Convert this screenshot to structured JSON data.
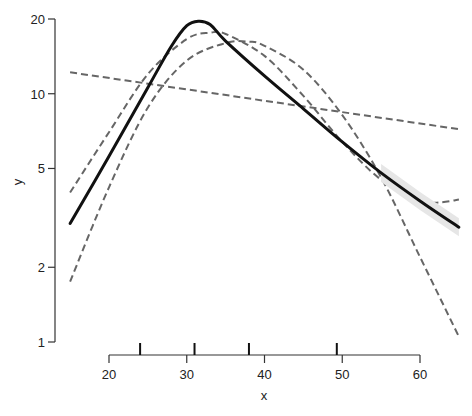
{
  "chart_data": {
    "type": "line",
    "title": "",
    "xlabel": "x",
    "ylabel": "y",
    "x_scale": "linear",
    "y_scale": "log",
    "xlim": [
      14,
      65
    ],
    "ylim": [
      1,
      20
    ],
    "x_ticks": [
      20,
      30,
      40,
      50,
      60
    ],
    "y_ticks": [
      1,
      2,
      5,
      10,
      20
    ],
    "x_tick_labels": [
      "20",
      "30",
      "40",
      "50",
      "60"
    ],
    "y_tick_labels": [
      "1",
      "2",
      "5",
      "10",
      "20"
    ],
    "grid": false,
    "legend": null,
    "rug_x": [
      24,
      31,
      38,
      49.3
    ],
    "series": [
      {
        "name": "piecewise fit",
        "style": "solid",
        "color": "#111111",
        "width": 3,
        "x": [
          15,
          20,
          25,
          28,
          30,
          31.5,
          33,
          35,
          40,
          45,
          50,
          55,
          60,
          65
        ],
        "y": [
          3.0,
          5.6,
          10.6,
          15.5,
          18.8,
          19.6,
          19.0,
          16.3,
          11.8,
          8.7,
          6.4,
          4.8,
          3.7,
          2.9
        ],
        "band": true
      },
      {
        "name": "linear fit",
        "style": "dashed",
        "color": "#666666",
        "width": 2,
        "x": [
          15,
          65
        ],
        "y": [
          12.2,
          7.2
        ]
      },
      {
        "name": "quadratic fit",
        "style": "dashed",
        "color": "#666666",
        "width": 2,
        "x": [
          15,
          20,
          25,
          30,
          35,
          38,
          40,
          45,
          50,
          55,
          60,
          65
        ],
        "y": [
          1.75,
          4.2,
          8.8,
          13.6,
          16.0,
          16.2,
          15.6,
          12.5,
          8.2,
          4.6,
          2.2,
          1.05
        ]
      },
      {
        "name": "cubic fit",
        "style": "dashed",
        "color": "#666666",
        "width": 2,
        "x": [
          15,
          20,
          25,
          30,
          33,
          35,
          40,
          45,
          50,
          55,
          60,
          62.5,
          65
        ],
        "y": [
          4.0,
          7.0,
          12.0,
          16.6,
          17.6,
          17.4,
          14.2,
          9.8,
          6.4,
          4.5,
          3.7,
          3.65,
          3.75
        ]
      }
    ]
  }
}
